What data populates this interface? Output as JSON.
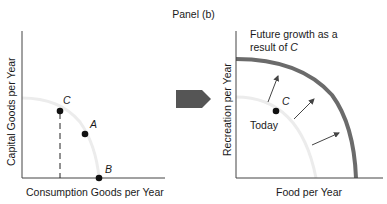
{
  "figure": {
    "panel_title": "Panel (b)",
    "left_graph": {
      "y_axis_label": "Capital Goods per Year",
      "x_axis_label": "Consumption Goods per Year",
      "curve": "production possibilities curve (faint)",
      "points": [
        {
          "label": "C",
          "position": "upper-left on curve, dashed drop line to x-axis"
        },
        {
          "label": "A",
          "position": "inside curve"
        },
        {
          "label": "B",
          "position": "on x-axis"
        }
      ]
    },
    "transition_arrow": "right-pointing block arrow",
    "right_graph": {
      "y_axis_label": "Recreation per Year",
      "x_axis_label": "Food per Year",
      "annotation_line1": "Future growth as a",
      "annotation_line2_prefix": "result of ",
      "annotation_line2_italic": "C",
      "point_label": "C",
      "today_label": "Today",
      "curves": [
        "today PPC (faint inner)",
        "future PPC (thick outer)"
      ],
      "shift_arrows": 3
    },
    "colors": {
      "axis": "#444444",
      "faint_curve": "#ececec",
      "outer_curve": "#6b6b6b",
      "block_arrow": "#555555",
      "point": "#111111"
    }
  }
}
